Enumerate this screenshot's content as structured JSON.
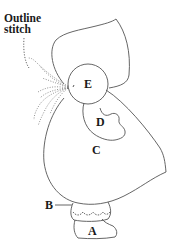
{
  "diagram": {
    "type": "embroidery pattern",
    "callout": {
      "line1": "Outline",
      "line2": "stitch"
    },
    "labels": {
      "A": "A",
      "B": "B",
      "C": "C",
      "D": "D",
      "E": "E"
    },
    "colors": {
      "line": "#444444",
      "text": "#1a1a1a",
      "background": "#ffffff"
    }
  }
}
